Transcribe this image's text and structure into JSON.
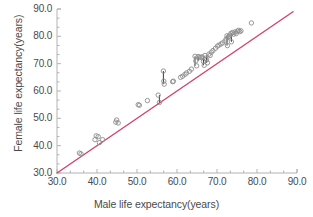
{
  "chart_data": {
    "type": "scatter",
    "title": "",
    "xlabel": "Male life expectancy(years)",
    "ylabel": "Female life expectancy(years)",
    "xlim": [
      30.0,
      90.0
    ],
    "ylim": [
      30.0,
      90.0
    ],
    "xticks": [
      "30.0",
      "40.0",
      "50.0",
      "60.0",
      "70.0",
      "80.0",
      "90.0"
    ],
    "yticks": [
      "30.0",
      "40.0",
      "50.0",
      "60.0",
      "70.0",
      "80.0",
      "90.0"
    ],
    "xtick_values": [
      30,
      40,
      50,
      60,
      70,
      80,
      90
    ],
    "ytick_values": [
      30,
      40,
      50,
      60,
      70,
      80,
      90
    ],
    "minor_ticks_per_interval": 2,
    "grid": false,
    "legend": "none",
    "marker": "open-circle",
    "marker_color": "#8c8c8c",
    "line_color": "#d4426f",
    "axis_color": "#b3b3b3",
    "fit_line": {
      "label": "identity / regression line",
      "x": [
        30.0,
        90.0
      ],
      "y": [
        30.0,
        90.0
      ],
      "color": "#d4426f",
      "visible_range_x": [
        30.0,
        89.0
      ]
    },
    "points": [
      {
        "x": 35.6,
        "y": 37.3
      },
      {
        "x": 36.0,
        "y": 37.0
      },
      {
        "x": 39.5,
        "y": 42.2
      },
      {
        "x": 39.8,
        "y": 43.6
      },
      {
        "x": 40.3,
        "y": 43.3
      },
      {
        "x": 40.6,
        "y": 41.1
      },
      {
        "x": 41.4,
        "y": 42.2
      },
      {
        "x": 44.7,
        "y": 48.6
      },
      {
        "x": 44.9,
        "y": 49.4
      },
      {
        "x": 45.3,
        "y": 48.3
      },
      {
        "x": 50.3,
        "y": 55.0
      },
      {
        "x": 50.6,
        "y": 54.8
      },
      {
        "x": 52.6,
        "y": 56.5
      },
      {
        "x": 55.3,
        "y": 58.5
      },
      {
        "x": 55.6,
        "y": 55.8
      },
      {
        "x": 56.6,
        "y": 67.3
      },
      {
        "x": 56.7,
        "y": 63.6
      },
      {
        "x": 56.8,
        "y": 62.5
      },
      {
        "x": 58.9,
        "y": 63.4
      },
      {
        "x": 59.1,
        "y": 63.6
      },
      {
        "x": 60.9,
        "y": 65.0
      },
      {
        "x": 61.4,
        "y": 65.4
      },
      {
        "x": 62.0,
        "y": 66.1
      },
      {
        "x": 62.4,
        "y": 66.6
      },
      {
        "x": 63.1,
        "y": 67.2
      },
      {
        "x": 63.6,
        "y": 68.0
      },
      {
        "x": 64.5,
        "y": 72.7
      },
      {
        "x": 64.7,
        "y": 71.0
      },
      {
        "x": 64.9,
        "y": 69.2
      },
      {
        "x": 65.3,
        "y": 72.6
      },
      {
        "x": 65.6,
        "y": 72.4
      },
      {
        "x": 66.0,
        "y": 72.3
      },
      {
        "x": 66.3,
        "y": 72.5
      },
      {
        "x": 66.6,
        "y": 70.8
      },
      {
        "x": 66.8,
        "y": 69.4
      },
      {
        "x": 67.0,
        "y": 73.0
      },
      {
        "x": 67.2,
        "y": 72.0
      },
      {
        "x": 67.4,
        "y": 71.4
      },
      {
        "x": 67.6,
        "y": 70.3
      },
      {
        "x": 68.0,
        "y": 73.5
      },
      {
        "x": 68.3,
        "y": 73.0
      },
      {
        "x": 68.6,
        "y": 74.2
      },
      {
        "x": 69.0,
        "y": 74.8
      },
      {
        "x": 69.6,
        "y": 75.6
      },
      {
        "x": 70.1,
        "y": 76.4
      },
      {
        "x": 70.5,
        "y": 76.8
      },
      {
        "x": 71.0,
        "y": 77.2
      },
      {
        "x": 71.4,
        "y": 77.6
      },
      {
        "x": 72.0,
        "y": 78.3
      },
      {
        "x": 72.3,
        "y": 79.0
      },
      {
        "x": 72.5,
        "y": 80.2
      },
      {
        "x": 72.6,
        "y": 76.6
      },
      {
        "x": 72.8,
        "y": 79.6
      },
      {
        "x": 73.0,
        "y": 80.0
      },
      {
        "x": 73.3,
        "y": 80.5
      },
      {
        "x": 73.5,
        "y": 81.1
      },
      {
        "x": 73.6,
        "y": 78.0
      },
      {
        "x": 73.9,
        "y": 81.4
      },
      {
        "x": 74.2,
        "y": 80.8
      },
      {
        "x": 74.5,
        "y": 81.6
      },
      {
        "x": 74.8,
        "y": 81.0
      },
      {
        "x": 75.1,
        "y": 81.9
      },
      {
        "x": 75.4,
        "y": 82.2
      },
      {
        "x": 75.7,
        "y": 81.7
      },
      {
        "x": 76.0,
        "y": 82.0
      },
      {
        "x": 78.6,
        "y": 84.9
      }
    ],
    "connectors": [
      {
        "x": 56.6,
        "y1": 67.3,
        "y2": 62.5
      },
      {
        "x": 55.6,
        "y1": 58.5,
        "y2": 55.8
      },
      {
        "x": 64.5,
        "y1": 72.7,
        "y2": 69.2
      },
      {
        "x": 66.6,
        "y1": 72.5,
        "y2": 69.4
      },
      {
        "x": 67.4,
        "y1": 73.0,
        "y2": 70.3
      },
      {
        "x": 72.5,
        "y1": 80.2,
        "y2": 76.6
      },
      {
        "x": 73.6,
        "y1": 81.1,
        "y2": 78.0
      },
      {
        "x": 65.3,
        "y1": 72.6,
        "y2": 71.0
      }
    ],
    "connector_color": "#3a3a3a"
  }
}
